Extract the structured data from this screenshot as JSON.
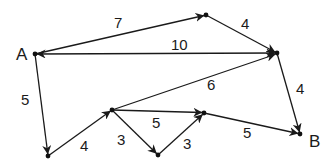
{
  "diagram": {
    "type": "directed-weighted-graph",
    "nodes": [
      {
        "id": "A",
        "label": "A",
        "x": 35,
        "y": 54
      },
      {
        "id": "T",
        "label": "",
        "x": 206,
        "y": 15
      },
      {
        "id": "R",
        "label": "",
        "x": 277,
        "y": 53
      },
      {
        "id": "M",
        "label": "",
        "x": 112,
        "y": 110
      },
      {
        "id": "BL",
        "label": "",
        "x": 48,
        "y": 156
      },
      {
        "id": "BM",
        "label": "",
        "x": 158,
        "y": 155
      },
      {
        "id": "MR",
        "label": "",
        "x": 204,
        "y": 113
      },
      {
        "id": "B",
        "label": "B",
        "x": 300,
        "y": 134
      }
    ],
    "edges": [
      {
        "from": "A",
        "to": "T",
        "weight": "7",
        "bidirectional": false
      },
      {
        "from": "T",
        "to": "R",
        "weight": "4",
        "bidirectional": false
      },
      {
        "from": "A",
        "to": "R",
        "weight": "10",
        "bidirectional": true
      },
      {
        "from": "M",
        "to": "R",
        "weight": "6",
        "bidirectional": false
      },
      {
        "from": "R",
        "to": "B",
        "weight": "4",
        "bidirectional": false
      },
      {
        "from": "A",
        "to": "BL",
        "weight": "5",
        "bidirectional": false
      },
      {
        "from": "BL",
        "to": "M",
        "weight": "4",
        "bidirectional": false
      },
      {
        "from": "M",
        "to": "MR",
        "weight": "5",
        "bidirectional": false
      },
      {
        "from": "M",
        "to": "BM",
        "weight": "3",
        "bidirectional": false
      },
      {
        "from": "BM",
        "to": "MR",
        "weight": "3",
        "bidirectional": false
      },
      {
        "from": "MR",
        "to": "B",
        "weight": "5",
        "bidirectional": false
      }
    ]
  },
  "labels": {
    "node_a": "A",
    "node_b": "B",
    "w_a_t": "7",
    "w_t_r": "4",
    "w_a_r": "10",
    "w_m_r": "6",
    "w_r_b": "4",
    "w_a_bl": "5",
    "w_bl_m": "4",
    "w_m_mr": "5",
    "w_m_bm": "3",
    "w_bm_mr": "3",
    "w_mr_b": "5"
  }
}
